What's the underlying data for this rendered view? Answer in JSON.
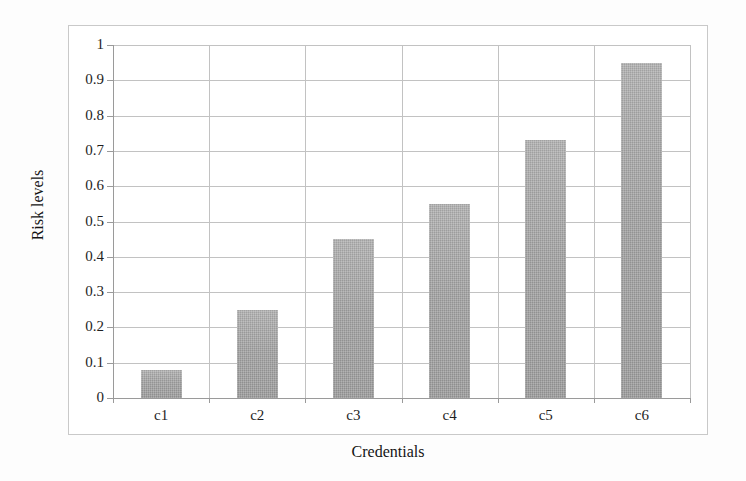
{
  "chart_data": {
    "type": "bar",
    "title": "",
    "subtitle": "",
    "xlabel": "Credentials",
    "ylabel": "Risk levels",
    "categories": [
      "c1",
      "c2",
      "c3",
      "c4",
      "c5",
      "c6"
    ],
    "values": [
      0.08,
      0.25,
      0.45,
      0.55,
      0.73,
      0.95
    ],
    "series": [
      {
        "name": "Risk levels",
        "values": [
          0.08,
          0.25,
          0.45,
          0.55,
          0.73,
          0.95
        ]
      }
    ],
    "ylim": [
      0,
      1
    ],
    "y_ticks": [
      0,
      0.1,
      0.2,
      0.3,
      0.4,
      0.5,
      0.6,
      0.7,
      0.8,
      0.9,
      1
    ],
    "y_tick_labels": [
      "0",
      "0.1",
      "0.2",
      "0.3",
      "0.4",
      "0.5",
      "0.6",
      "0.7",
      "0.8",
      "0.9",
      "1"
    ],
    "grid": {
      "horizontal": true,
      "vertical": true
    },
    "legend": {
      "visible": false,
      "position": "none",
      "entries": []
    },
    "annotations": [],
    "colors": {
      "bar_fill": "#a6a6a6",
      "gridline": "#c2c2c2",
      "axis_line": "#9a9a9a",
      "frame_border": "#c9c9c9",
      "text": "#1f1f1f",
      "background": "#ffffff"
    }
  }
}
